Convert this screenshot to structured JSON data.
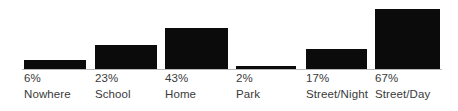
{
  "chart_data": {
    "type": "bar",
    "title": "",
    "subtitle": "",
    "xlabel": "",
    "ylabel": "",
    "grid": false,
    "legend": null,
    "legend_position": "none",
    "ylim": [
      0,
      73
    ],
    "bar_color": "#0b0b0b",
    "axis_color": "#b9b9b9",
    "label_color": "#3a3a3a",
    "categories": [
      "Nowhere",
      "School",
      "Home",
      "Park",
      "Street/Night",
      "Street/Day"
    ],
    "values": [
      6,
      23,
      43,
      2,
      17,
      67
    ],
    "value_labels": [
      "6%",
      "23%",
      "43%",
      "2%",
      "17%",
      "67%"
    ],
    "bars": [
      {
        "label": "Nowhere",
        "value": 6,
        "value_label": "6%",
        "x": 24,
        "width": 62,
        "height": 10
      },
      {
        "label": "School",
        "value": 23,
        "value_label": "23%",
        "x": 95,
        "width": 62,
        "height": 25
      },
      {
        "label": "Home",
        "value": 43,
        "value_label": "43%",
        "x": 165,
        "width": 63,
        "height": 42
      },
      {
        "label": "Park",
        "value": 2,
        "value_label": "2%",
        "x": 236,
        "width": 60,
        "height": 4
      },
      {
        "label": "Street/Night",
        "value": 17,
        "value_label": "17%",
        "x": 306,
        "width": 61,
        "height": 21
      },
      {
        "label": "Street/Day",
        "value": 67,
        "value_label": "67%",
        "x": 375,
        "width": 65,
        "height": 61
      }
    ]
  }
}
